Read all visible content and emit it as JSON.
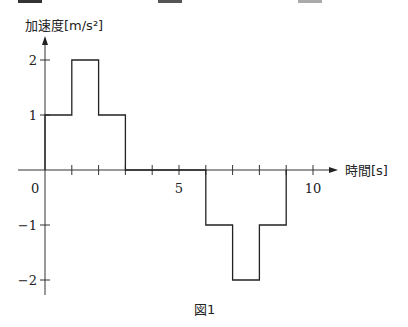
{
  "top_marks": [
    {
      "x": 18,
      "color": "#333333"
    },
    {
      "x": 158,
      "color": "#555555"
    },
    {
      "x": 298,
      "color": "#aaaaaa"
    }
  ],
  "caption": "図1",
  "chart_data": {
    "type": "line",
    "subtype": "step",
    "title": "",
    "xlabel": "時間[s]",
    "ylabel": "加速度[m/s²]",
    "x_tick_labels": [
      "0",
      "5",
      "10"
    ],
    "x_ticks": [
      0,
      1,
      2,
      3,
      4,
      5,
      6,
      7,
      8,
      9,
      10
    ],
    "y_tick_labels": [
      "2",
      "1",
      "−1",
      "−2"
    ],
    "y_ticks": [
      2,
      1,
      -1,
      -2
    ],
    "xlim": [
      0,
      10.5
    ],
    "ylim": [
      -2.3,
      2.6
    ],
    "grid": false,
    "legend": null,
    "segments": [
      {
        "t_start": 0,
        "t_end": 1,
        "a": 1
      },
      {
        "t_start": 1,
        "t_end": 2,
        "a": 2
      },
      {
        "t_start": 2,
        "t_end": 3,
        "a": 1
      },
      {
        "t_start": 3,
        "t_end": 6,
        "a": 0
      },
      {
        "t_start": 6,
        "t_end": 7,
        "a": -1
      },
      {
        "t_start": 7,
        "t_end": 8,
        "a": -2
      },
      {
        "t_start": 8,
        "t_end": 9,
        "a": -1
      }
    ],
    "x": [
      0,
      0,
      1,
      1,
      2,
      2,
      3,
      3,
      6,
      6,
      7,
      7,
      8,
      8,
      9,
      9
    ],
    "y": [
      0,
      1,
      1,
      2,
      2,
      1,
      1,
      0,
      0,
      -1,
      -1,
      -2,
      -2,
      -1,
      -1,
      0
    ]
  }
}
